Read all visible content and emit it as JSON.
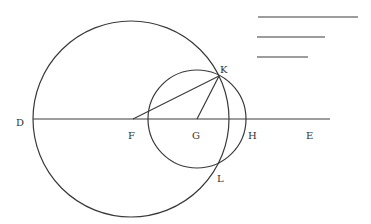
{
  "diagram": {
    "colors": {
      "stroke": "#3a3a3a",
      "label": "#333333",
      "background": "#ffffff"
    },
    "points": {
      "D": {
        "label": "D",
        "x": 33,
        "y": 119
      },
      "F": {
        "label": "F",
        "x": 133,
        "y": 119
      },
      "G": {
        "label": "G",
        "x": 197,
        "y": 119
      },
      "H": {
        "label": "H",
        "x": 246,
        "y": 119
      },
      "E": {
        "label": "E",
        "x": 330,
        "y": 119
      },
      "K": {
        "label": "K",
        "x": 219,
        "y": 76
      },
      "L": {
        "label": "L",
        "x": 217,
        "y": 166
      }
    },
    "circles": [
      {
        "name": "large-circle",
        "cx": 131,
        "cy": 119,
        "r": 98
      },
      {
        "name": "small-circle",
        "cx": 197,
        "cy": 119,
        "r": 49
      }
    ],
    "segments": [
      {
        "name": "line-DE",
        "from": "D",
        "to": "E"
      },
      {
        "name": "line-FK",
        "from": "F",
        "to": "K"
      },
      {
        "name": "line-GK",
        "from": "G",
        "to": "K"
      }
    ],
    "reference_lines": [
      {
        "name": "reference-line-1",
        "x1": 258,
        "x2": 358,
        "y": 17
      },
      {
        "name": "reference-line-2",
        "x1": 257,
        "x2": 325,
        "y": 37
      },
      {
        "name": "reference-line-3",
        "x1": 257,
        "x2": 308,
        "y": 57
      }
    ]
  }
}
